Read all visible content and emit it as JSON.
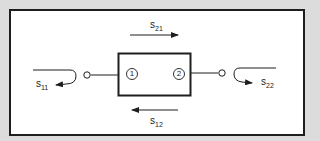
{
  "diagram": {
    "colors": {
      "background": "#dcdcdc",
      "frame_fill": "#ffffff",
      "stroke": "#1e1e1e"
    },
    "network": {
      "ports": [
        {
          "id": "1",
          "label": "1"
        },
        {
          "id": "2",
          "label": "2"
        }
      ]
    },
    "parameters": {
      "s21": {
        "base": "s",
        "sub": "21",
        "direction": "forward transmission (left to right, above box)"
      },
      "s12": {
        "base": "s",
        "sub": "12",
        "direction": "reverse transmission (right to left, below box)"
      },
      "s11": {
        "base": "s",
        "sub": "11",
        "direction": "input reflection at port 1"
      },
      "s22": {
        "base": "s",
        "sub": "22",
        "direction": "output reflection at port 2"
      }
    }
  }
}
